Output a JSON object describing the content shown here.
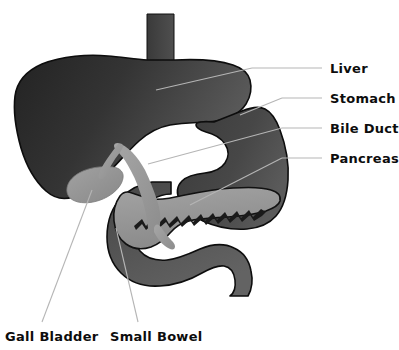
{
  "figure": {
    "background_color": "#ffffff",
    "leader_line_color": "#b3b3b3",
    "label_text_color": "#0d0d0d"
  },
  "labels": {
    "liver": "Liver",
    "stomach": "Stomach",
    "bile_duct": "Bile Duct",
    "pancreas": "Pancreas",
    "gall_bladder": "Gall Bladder",
    "small_bowel": "Small Bowel"
  },
  "organs": [
    {
      "name": "esophagus",
      "label": "",
      "fill_dark": "#3b3b3b",
      "fill_light": "#4f4f4f",
      "callout": false
    },
    {
      "name": "liver",
      "label": "Liver",
      "fill_dark": "#262626",
      "fill_light": "#595959",
      "outline": "#111111",
      "callout": true,
      "callout_side": "right"
    },
    {
      "name": "stomach",
      "label": "Stomach",
      "fill_dark": "#3e3e3e",
      "fill_light": "#555555",
      "outline": "#111111",
      "callout": true,
      "callout_side": "right"
    },
    {
      "name": "bile-duct",
      "label": "Bile Duct",
      "fill_dark": "#8f8f8f",
      "fill_light": "#a8a8a8",
      "outline": "#6f6f6f",
      "callout": true,
      "callout_side": "right"
    },
    {
      "name": "pancreas",
      "label": "Pancreas",
      "fill_dark": "#8d8d8d",
      "fill_light": "#a5a5a5",
      "outline": "#141414",
      "duct_color": "#1a1a1a",
      "callout": true,
      "callout_side": "right"
    },
    {
      "name": "gall-bladder",
      "label": "Gall Bladder",
      "fill_dark": "#8b8b8b",
      "fill_light": "#a0a0a0",
      "callout": true,
      "callout_side": "bottom"
    },
    {
      "name": "small-bowel",
      "label": "Small Bowel",
      "fill_dark": "#4a4a4a",
      "fill_light": "#626262",
      "outline": "#111111",
      "callout": true,
      "callout_side": "bottom"
    }
  ]
}
